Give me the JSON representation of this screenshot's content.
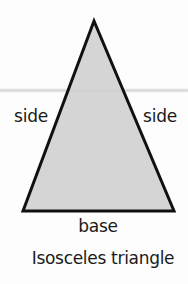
{
  "figure": {
    "shape": "isosceles-triangle",
    "fill_color": "#cfcfcf",
    "stroke_color": "#111111",
    "vertices": {
      "apex": [
        94,
        20
      ],
      "base_left": [
        23,
        211
      ],
      "base_right": [
        174,
        211
      ]
    }
  },
  "labels": {
    "left_side": "side",
    "right_side": "side",
    "base": "base"
  },
  "caption": "Isosceles triangle"
}
